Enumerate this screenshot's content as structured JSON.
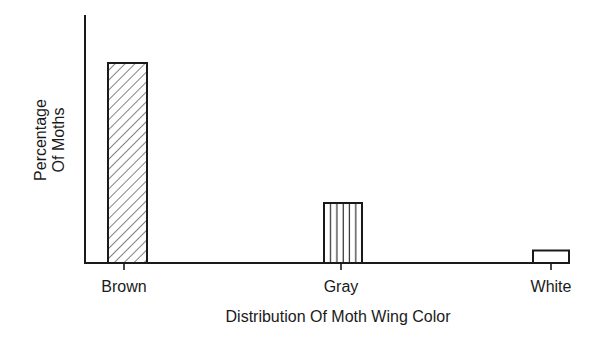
{
  "chart_data": {
    "type": "bar",
    "title": "",
    "xlabel": "Distribution Of Moth Wing Color",
    "ylabel": "Percentage Of Moths",
    "ylabel_lines": [
      "Percentage",
      "Of Moths"
    ],
    "categories": [
      "Brown",
      "Gray",
      "White"
    ],
    "values": [
      80,
      24,
      5
    ],
    "value_note": "No numeric axis ticks shown; values are relative heights estimated as % of axis length",
    "ylim": [
      0,
      100
    ],
    "grid": false,
    "legend": null,
    "bar_patterns": [
      "diagonal-hatch",
      "vertical-lines",
      "none"
    ]
  },
  "colors": {
    "ink": "#1a1a1a",
    "background": "#ffffff"
  }
}
